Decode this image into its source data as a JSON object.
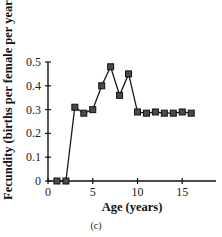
{
  "chart_data": {
    "type": "line",
    "title": "",
    "caption": "(c)",
    "xlabel": "Age (years)",
    "ylabel": "Fecundity (births per female per year)",
    "xlim": [
      0,
      19
    ],
    "ylim": [
      0,
      0.5
    ],
    "xticks": [
      0,
      5,
      10,
      15
    ],
    "yticks": [
      0,
      0.1,
      0.2,
      0.3,
      0.4,
      0.5
    ],
    "xtick_labels": [
      "0",
      "5",
      "10",
      "15"
    ],
    "ytick_labels": [
      "0",
      "0.1",
      "0.2",
      "0.3",
      "0.4",
      "0.5"
    ],
    "grid": false,
    "legend": null,
    "marker": "square",
    "series": [
      {
        "name": "Fecundity",
        "x": [
          1,
          2,
          3,
          4,
          5,
          6,
          7,
          8,
          9,
          10,
          11,
          12,
          13,
          14,
          15,
          16
        ],
        "y": [
          0,
          0,
          0.31,
          0.285,
          0.3,
          0.4,
          0.48,
          0.36,
          0.45,
          0.29,
          0.285,
          0.29,
          0.285,
          0.285,
          0.29,
          0.285
        ]
      }
    ]
  },
  "colors": {
    "line": "#1a1a1a",
    "marker_fill": "#4a4a4a",
    "marker_stroke": "#111111"
  }
}
